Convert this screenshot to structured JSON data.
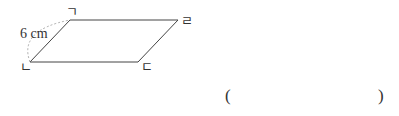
{
  "figure": {
    "shape": "parallelogram",
    "vertices": {
      "top_left": "ㄱ",
      "bottom_left": "ㄴ",
      "bottom_right": "ㄷ",
      "top_right": "ㄹ"
    },
    "side_length_label": "6 cm"
  },
  "answer": {
    "open": "(",
    "close": ")",
    "value": ""
  }
}
